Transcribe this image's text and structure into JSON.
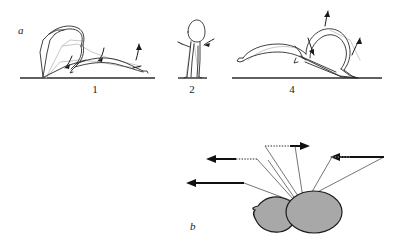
{
  "figure": {
    "background_color": "#ffffff",
    "ink_color": "#1a1a1a",
    "ghost_color": "#b9b9b9",
    "body_fill_color": "#a8a8a8",
    "body_outline_color": "#1c1c1c",
    "width": 395,
    "height": 243
  },
  "panels": [
    {
      "id": "panel-a",
      "letter": "a",
      "letter_position": {
        "x": 18,
        "y": 34
      },
      "description": "Sequence of insect body postures during a jump, drawn as outline stick figures on ground lines with curved motion arrows",
      "steps": [
        {
          "number": "1",
          "label_position": {
            "x": 95,
            "y": 93
          },
          "ground_line": {
            "x1": 20,
            "y1": 78,
            "x2": 155,
            "y2": 78
          },
          "posture": "crouched, body raised at left with hind legs folded, abdomen extended to the right"
        },
        {
          "number": "2",
          "label_position": {
            "x": 192,
            "y": 93
          },
          "ground_line": {
            "x1": 178,
            "y1": 78,
            "x2": 207,
            "y2": 78
          },
          "posture": "upright vertical body standing on ground"
        },
        {
          "number": "4",
          "label_position": {
            "x": 292,
            "y": 93
          },
          "ground_line": {
            "x1": 232,
            "y1": 78,
            "x2": 382,
            "y2": 78
          },
          "posture": "body angled forward-down to the right, abdomen extended left, legs extended"
        }
      ]
    },
    {
      "id": "panel-b",
      "letter": "b",
      "letter_position": {
        "x": 190,
        "y": 230
      },
      "description": "Top view of insect thorax and abdomen with radiating force vectors; thin outbound lines terminate in thick directional arrows",
      "body_parts": [
        {
          "name": "thorax-blob",
          "fill": "#a8a8a8",
          "cx": 272,
          "cy": 214,
          "rx": 22,
          "ry": 17
        },
        {
          "name": "abdomen-blob",
          "fill": "#a8a8a8",
          "cx": 313,
          "cy": 212,
          "rx": 28,
          "ry": 21
        }
      ],
      "vector_count": 6,
      "vectors": [
        {
          "name": "vector-left-low",
          "direction": "left",
          "origin": {
            "x": 290,
            "y": 200
          },
          "bend": {
            "x": 230,
            "y": 183
          },
          "tip": {
            "x": 186,
            "y": 183
          }
        },
        {
          "name": "vector-left-upper",
          "direction": "left",
          "origin": {
            "x": 292,
            "y": 200
          },
          "bend": {
            "x": 256,
            "y": 159
          },
          "tip": {
            "x": 205,
            "y": 159
          }
        },
        {
          "name": "vector-left-top-dotted",
          "direction": "left",
          "origin": {
            "x": 294,
            "y": 199
          },
          "bend": {
            "x": 258,
            "y": 159
          },
          "tip": {
            "x": 206,
            "y": 159
          }
        },
        {
          "name": "vector-top-right",
          "direction": "right",
          "origin": {
            "x": 300,
            "y": 199
          },
          "bend": {
            "x": 265,
            "y": 145
          },
          "tip": {
            "x": 309,
            "y": 145
          }
        },
        {
          "name": "vector-upper-right-dotted",
          "direction": "right",
          "origin": {
            "x": 302,
            "y": 198
          },
          "bend": {
            "x": 316,
            "y": 146
          },
          "tip": {
            "x": 312,
            "y": 146
          }
        },
        {
          "name": "vector-right",
          "direction": "left-pointing",
          "origin": {
            "x": 305,
            "y": 198
          },
          "bend": {
            "x": 383,
            "y": 157
          },
          "tip": {
            "x": 330,
            "y": 157
          }
        }
      ]
    }
  ]
}
